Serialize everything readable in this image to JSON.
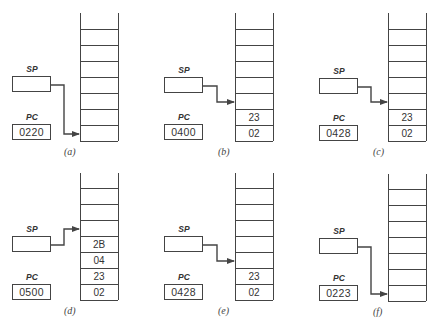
{
  "diagram": {
    "register_labels": {
      "sp": "SP",
      "pc": "PC"
    },
    "panels": [
      {
        "id": "a",
        "caption": "(a)",
        "pc_value": "0220",
        "sp_value": "",
        "stack_cells": [],
        "sp_points_to_row": 0
      },
      {
        "id": "b",
        "caption": "(b)",
        "pc_value": "0400",
        "sp_value": "",
        "stack_cells": [
          "02",
          "23"
        ],
        "sp_points_to_row": 2
      },
      {
        "id": "c",
        "caption": "(c)",
        "pc_value": "0428",
        "sp_value": "",
        "stack_cells": [
          "02",
          "23"
        ],
        "sp_points_to_row": 2
      },
      {
        "id": "d",
        "caption": "(d)",
        "pc_value": "0500",
        "sp_value": "",
        "stack_cells": [
          "02",
          "23",
          "04",
          "2B"
        ],
        "sp_points_to_row": 4
      },
      {
        "id": "e",
        "caption": "(e)",
        "pc_value": "0428",
        "sp_value": "",
        "stack_cells": [
          "02",
          "23"
        ],
        "sp_points_to_row": 2
      },
      {
        "id": "f",
        "caption": "(f)",
        "pc_value": "0223",
        "sp_value": "",
        "stack_cells": [],
        "sp_points_to_row": 0
      }
    ],
    "stack_rows_visible": 7,
    "line_color": "#444444"
  }
}
